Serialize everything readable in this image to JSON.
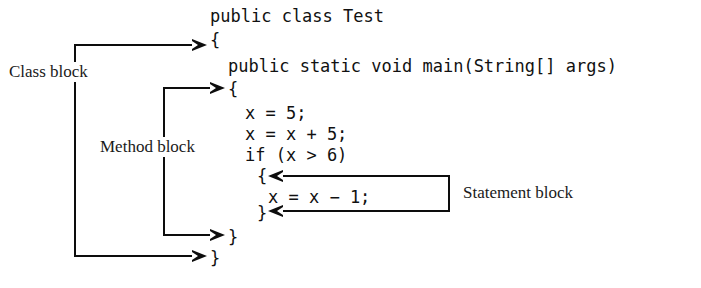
{
  "figure": {
    "kind": "java-code-block-annotation-diagram",
    "background_color": "#ffffff",
    "stroke_color": "#0d0d0d",
    "text_color": "#111111"
  },
  "code": {
    "lines": [
      {
        "id": "class_decl",
        "text": "public class Test"
      },
      {
        "id": "class_open",
        "text": "{"
      },
      {
        "id": "method_decl",
        "text": "public static void main(String[] args)"
      },
      {
        "id": "method_open",
        "text": "{"
      },
      {
        "id": "stmt_assign",
        "text": "x = 5;"
      },
      {
        "id": "stmt_add",
        "text": "x = x + 5;"
      },
      {
        "id": "if_decl",
        "text": "if (x > 6)"
      },
      {
        "id": "if_open",
        "text": "{"
      },
      {
        "id": "stmt_sub",
        "text": "x = x − 1;"
      },
      {
        "id": "if_close",
        "text": "}"
      },
      {
        "id": "method_close",
        "text": "}"
      },
      {
        "id": "class_close",
        "text": "}"
      }
    ]
  },
  "annotations": {
    "class_block": {
      "label": "Class block"
    },
    "method_block": {
      "label": "Method block"
    },
    "statement_block": {
      "label": "Statement block"
    }
  }
}
